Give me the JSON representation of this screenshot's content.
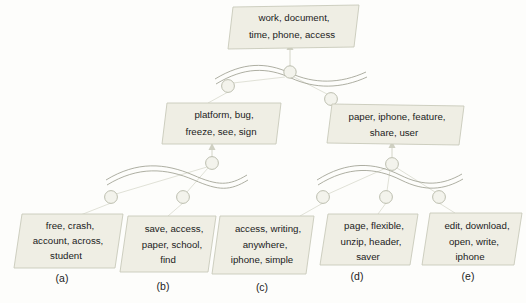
{
  "diagram": {
    "type": "hierarchical-topic-tree",
    "background_color": "#fdfdfb",
    "node_fill": "#efeee4",
    "node_border": "#c8c9ba",
    "wave_color": "#9a9c8c",
    "edge_color": "#ddded2",
    "root": {
      "id": "root",
      "label": "work, document,\ntime, phone, access",
      "line1": "work, document,",
      "line2": "time, phone, access"
    },
    "level2": [
      {
        "id": "n-left",
        "line1": "platform, bug,",
        "line2": "freeze, see, sign"
      },
      {
        "id": "n-right",
        "line1": "paper, iphone, feature,",
        "line2": "share, user"
      }
    ],
    "leaves": [
      {
        "id": "leaf-a",
        "sub_label": "(a)",
        "line1": "free, crash,",
        "line2": "account, across,",
        "line3": "student"
      },
      {
        "id": "leaf-b",
        "sub_label": "(b)",
        "line1": "save, access,",
        "line2": "paper, school,",
        "line3": "find"
      },
      {
        "id": "leaf-c",
        "sub_label": "(c)",
        "line1": "access, writing,",
        "line2": "anywhere,",
        "line3": "iphone, simple"
      },
      {
        "id": "leaf-d",
        "sub_label": "(d)",
        "line1": "page, flexible,",
        "line2": "unzip, header,",
        "line3": "saver"
      },
      {
        "id": "leaf-e",
        "sub_label": "(e)",
        "line1": "edit, download,",
        "line2": "open, write,",
        "line3": "iphone"
      }
    ]
  }
}
